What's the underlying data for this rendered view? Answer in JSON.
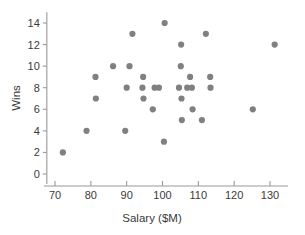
{
  "chart_data": {
    "type": "scatter",
    "title": "",
    "xlabel": "Salary ($M)",
    "ylabel": "Wins",
    "xlim": [
      68,
      135
    ],
    "ylim": [
      0,
      15
    ],
    "xticks": [
      70,
      80,
      90,
      100,
      110,
      120,
      130
    ],
    "xtick_labels": [
      "70",
      "80",
      "90",
      "100",
      "110",
      "120",
      "130"
    ],
    "yticks": [
      0,
      2,
      4,
      6,
      8,
      10,
      12,
      14
    ],
    "ytick_labels": [
      "0",
      "2",
      "4",
      "6",
      "8",
      "10",
      "12",
      "14"
    ],
    "grid": false,
    "legend": null,
    "marker_color": "#808080",
    "marker_size": 3.1,
    "n_points": 35,
    "points": [
      {
        "x": 72.2,
        "y": 2
      },
      {
        "x": 78.8,
        "y": 4
      },
      {
        "x": 81.3,
        "y": 9
      },
      {
        "x": 81.4,
        "y": 7
      },
      {
        "x": 86.2,
        "y": 10
      },
      {
        "x": 89.6,
        "y": 4
      },
      {
        "x": 90.0,
        "y": 8
      },
      {
        "x": 90.8,
        "y": 10
      },
      {
        "x": 91.6,
        "y": 13
      },
      {
        "x": 94.4,
        "y": 8
      },
      {
        "x": 94.6,
        "y": 9
      },
      {
        "x": 94.7,
        "y": 7
      },
      {
        "x": 97.3,
        "y": 6
      },
      {
        "x": 97.8,
        "y": 8
      },
      {
        "x": 99.0,
        "y": 8
      },
      {
        "x": 100.4,
        "y": 3
      },
      {
        "x": 100.6,
        "y": 14
      },
      {
        "x": 104.6,
        "y": 8
      },
      {
        "x": 105.1,
        "y": 10
      },
      {
        "x": 105.2,
        "y": 12
      },
      {
        "x": 105.3,
        "y": 7
      },
      {
        "x": 105.4,
        "y": 5
      },
      {
        "x": 106.9,
        "y": 8
      },
      {
        "x": 107.7,
        "y": 9
      },
      {
        "x": 108.2,
        "y": 8
      },
      {
        "x": 108.4,
        "y": 6
      },
      {
        "x": 111.0,
        "y": 5
      },
      {
        "x": 112.1,
        "y": 13
      },
      {
        "x": 113.3,
        "y": 9
      },
      {
        "x": 113.4,
        "y": 8
      },
      {
        "x": 125.2,
        "y": 6
      },
      {
        "x": 131.3,
        "y": 12
      }
    ]
  },
  "axis": {
    "y_title": "Wins",
    "x_title": "Salary ($M)"
  }
}
